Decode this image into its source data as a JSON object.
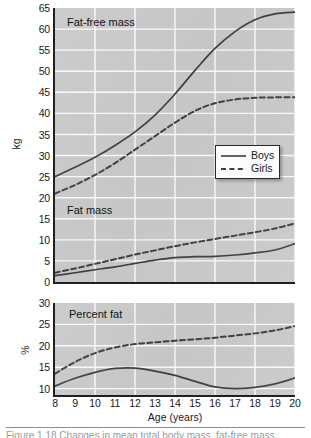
{
  "figure": {
    "caption": "Figure 1.18 Changes in mean total body mass, fat-free mass,",
    "background_color": "#c9c9c9",
    "gridline_color": "#ffffff",
    "axis_color": "#202020",
    "series_color": "#3f3f3f"
  },
  "axis_x": {
    "label": "Age (years)",
    "ticks": [
      "8",
      "9",
      "10",
      "11",
      "12",
      "13",
      "14",
      "15",
      "16",
      "17",
      "18",
      "19",
      "20"
    ],
    "min": 8,
    "max": 20,
    "gridline_every": 2
  },
  "legend": {
    "items": [
      {
        "label": "Boys",
        "style": "solid"
      },
      {
        "label": "Girls",
        "style": "dashed"
      }
    ]
  },
  "panel_top": {
    "ylabel": "kg",
    "yticks": [
      "0",
      "5",
      "10",
      "15",
      "20",
      "25",
      "30",
      "35",
      "40",
      "45",
      "50",
      "55",
      "60",
      "65"
    ],
    "ymin": 0,
    "ymax": 65,
    "annotation_upper": "Fat-free mass",
    "annotation_lower": "Fat mass"
  },
  "panel_bottom": {
    "ylabel": "%",
    "yticks": [
      "10",
      "15",
      "20",
      "25",
      "30"
    ],
    "ymin": 8.5,
    "ymax": 30,
    "annotation": "Percent fat"
  },
  "chart_data": [
    {
      "type": "line",
      "title": "Fat-free mass",
      "xlabel": "Age (years)",
      "ylabel": "kg",
      "xlim": [
        8,
        20
      ],
      "ylim": [
        0,
        65
      ],
      "grid": true,
      "legend_position": "center-right",
      "x": [
        8,
        9,
        10,
        11,
        12,
        13,
        14,
        15,
        16,
        17,
        18,
        19,
        20
      ],
      "series": [
        {
          "name": "Boys",
          "style": "solid",
          "values": [
            25.0,
            27.2,
            29.6,
            32.4,
            35.6,
            39.6,
            44.6,
            50.2,
            55.4,
            59.4,
            62.2,
            63.6,
            64.0
          ]
        },
        {
          "name": "Girls",
          "style": "dashed",
          "values": [
            21.0,
            23.0,
            25.4,
            28.2,
            31.4,
            34.6,
            37.8,
            40.6,
            42.4,
            43.3,
            43.7,
            43.8,
            43.8
          ]
        }
      ]
    },
    {
      "type": "line",
      "title": "Fat mass",
      "xlabel": "Age (years)",
      "ylabel": "kg",
      "xlim": [
        8,
        20
      ],
      "ylim": [
        0,
        65
      ],
      "grid": true,
      "x": [
        8,
        9,
        10,
        11,
        12,
        13,
        14,
        15,
        16,
        17,
        18,
        19,
        20
      ],
      "series": [
        {
          "name": "Boys",
          "style": "solid",
          "values": [
            1.5,
            2.2,
            2.9,
            3.6,
            4.4,
            5.2,
            5.8,
            6.0,
            6.1,
            6.4,
            6.9,
            7.6,
            9.1
          ]
        },
        {
          "name": "Girls",
          "style": "dashed",
          "values": [
            2.2,
            3.2,
            4.3,
            5.4,
            6.5,
            7.5,
            8.5,
            9.4,
            10.2,
            11.0,
            11.8,
            12.7,
            13.9
          ]
        }
      ]
    },
    {
      "type": "line",
      "title": "Percent fat",
      "xlabel": "Age (years)",
      "ylabel": "%",
      "xlim": [
        8,
        20
      ],
      "ylim": [
        8.5,
        30
      ],
      "grid": true,
      "x": [
        8,
        9,
        10,
        11,
        12,
        13,
        14,
        15,
        16,
        17,
        18,
        19,
        20
      ],
      "series": [
        {
          "name": "Boys",
          "style": "solid",
          "values": [
            10.6,
            12.4,
            13.8,
            14.7,
            14.8,
            14.1,
            13.1,
            11.7,
            10.4,
            10.0,
            10.3,
            11.1,
            12.5
          ]
        },
        {
          "name": "Girls",
          "style": "dashed",
          "values": [
            13.5,
            16.2,
            18.3,
            19.6,
            20.4,
            20.8,
            21.2,
            21.5,
            21.9,
            22.4,
            22.9,
            23.6,
            24.6
          ]
        }
      ]
    }
  ]
}
